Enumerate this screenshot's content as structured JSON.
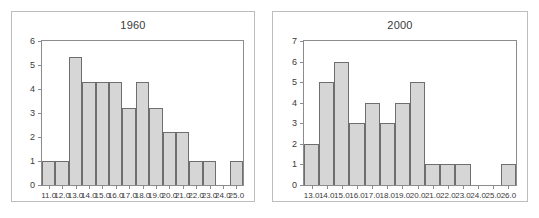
{
  "chart_data": [
    {
      "type": "bar",
      "title": "1960",
      "xlabel": "",
      "ylabel": "",
      "grid": false,
      "legend": "none",
      "xlim": [
        10.5,
        25.5
      ],
      "ylim": [
        0,
        6
      ],
      "ytick_labels": [
        "0",
        "1",
        "2",
        "3",
        "4",
        "5",
        "6"
      ],
      "yticks": [
        0,
        1,
        2,
        3,
        4,
        5,
        6
      ],
      "xtick_labels": [
        "11.0",
        "12.0",
        "13.0",
        "14.0",
        "15.0",
        "16.0",
        "17.0",
        "18.0",
        "19.0",
        "20.0",
        "21.0",
        "22.0",
        "23.0",
        "24.0",
        "25.0"
      ],
      "categories": [
        11,
        12,
        13,
        14,
        15,
        16,
        17,
        18,
        19,
        20,
        21,
        22,
        23,
        24,
        25
      ],
      "values": [
        1,
        1,
        5.35,
        4.3,
        4.3,
        4.3,
        3.2,
        4.3,
        3.2,
        2.2,
        2.2,
        1,
        1,
        0,
        1
      ]
    },
    {
      "type": "bar",
      "title": "2000",
      "xlabel": "",
      "ylabel": "",
      "grid": false,
      "legend": "none",
      "xlim": [
        12.5,
        26.5
      ],
      "ylim": [
        0,
        7
      ],
      "ytick_labels": [
        "0",
        "1",
        "2",
        "3",
        "4",
        "5",
        "6",
        "7"
      ],
      "yticks": [
        0,
        1,
        2,
        3,
        4,
        5,
        6,
        7
      ],
      "xtick_labels": [
        "13.0",
        "14.0",
        "15.0",
        "16.0",
        "17.0",
        "18.0",
        "19.0",
        "20.0",
        "21.0",
        "22.0",
        "23.0",
        "24.0",
        "25.0",
        "26.0"
      ],
      "categories": [
        13,
        14,
        15,
        16,
        17,
        18,
        19,
        20,
        21,
        22,
        23,
        24,
        25,
        26
      ],
      "values": [
        2,
        5,
        6,
        3,
        4,
        3,
        4,
        5,
        1,
        1,
        1,
        0,
        0,
        1
      ]
    }
  ],
  "colors": {
    "bar_fill": "#d6d6d6",
    "bar_stroke": "#6e6e6e",
    "axis": "#8c8c8c",
    "panel_border": "#bdbdbd",
    "text": "#3a3a3a",
    "background": "#ffffff"
  }
}
